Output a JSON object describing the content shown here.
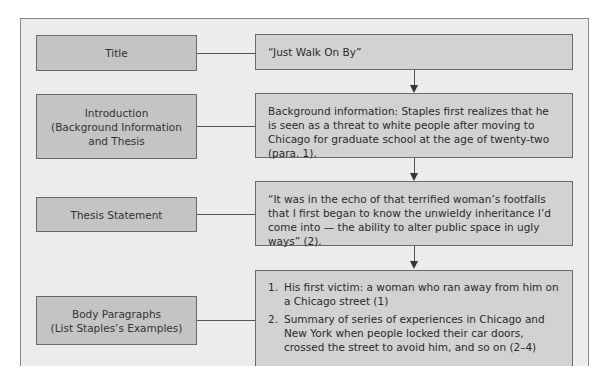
{
  "diagram": {
    "rows": [
      {
        "label": "Title",
        "content": "“Just Walk On By”"
      },
      {
        "label_lines": [
          "Introduction",
          "(Background Information",
          "and Thesis"
        ],
        "content": "Background information: Staples first realizes that he is seen as a threat to white people after moving to Chicago for graduate school at the age of twenty-two (para. 1)."
      },
      {
        "label": "Thesis Statement",
        "content": "“It was in the echo of that terrified woman’s footfalls that I first began to know the unwieldy inheritance I’d come into — the ability to alter public space in ugly ways” (2)."
      },
      {
        "label_lines": [
          "Body Paragraphs",
          "(List Staples’s Examples)"
        ],
        "list": [
          {
            "num": "1.",
            "text": "His first victim: a woman who ran away from him on a Chicago street (1)"
          },
          {
            "num": "2.",
            "text": "Summary of series of experiences in Chicago and New York when people locked their car doors, crossed the street to avoid him, and so on (2–4)"
          }
        ]
      }
    ],
    "connector_icons": [
      "arrow-down-icon",
      "arrow-down-icon",
      "arrow-down-icon"
    ],
    "colors": {
      "panel_bg": "#ececec",
      "label_box": "#c4c4c4",
      "content_box": "#d2d2d2",
      "border": "#6a6a6a"
    }
  }
}
